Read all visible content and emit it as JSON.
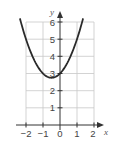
{
  "chart_data": {
    "type": "line",
    "title": "",
    "xlabel": "x",
    "ylabel": "y",
    "function": "y = x^2 + x + 3",
    "xlim": [
      -2,
      2
    ],
    "ylim": [
      0,
      6
    ],
    "grid": true,
    "legend": null,
    "x_ticks": [
      -2,
      -1,
      0,
      1,
      2
    ],
    "y_ticks": [
      1,
      2,
      3,
      4,
      5,
      6
    ],
    "x_tick_labels": [
      "−2",
      "−1",
      "0",
      "1",
      "2"
    ],
    "y_tick_labels": [
      "1",
      "2",
      "3",
      "4",
      "5",
      "6"
    ],
    "series": [
      {
        "name": "parabola",
        "x": [
          -2.35,
          -2,
          -1.5,
          -1,
          -0.5,
          0,
          0.5,
          1,
          1.35
        ],
        "y": [
          6.17,
          5,
          3.75,
          3,
          2.75,
          3,
          3.75,
          5,
          6.17
        ]
      }
    ],
    "vertex": {
      "x": -0.5,
      "y": 2.75
    },
    "y_intercept": 3
  },
  "axes": {
    "x_label": "x",
    "y_label": "y"
  },
  "ticks": {
    "x": [
      "−2",
      "−1",
      "0",
      "1",
      "2"
    ],
    "y": [
      "1",
      "2",
      "3",
      "4",
      "5",
      "6"
    ]
  },
  "colors": {
    "curve": "#2a2a2a",
    "grid": "#c8c8c8",
    "axis": "#333333"
  }
}
